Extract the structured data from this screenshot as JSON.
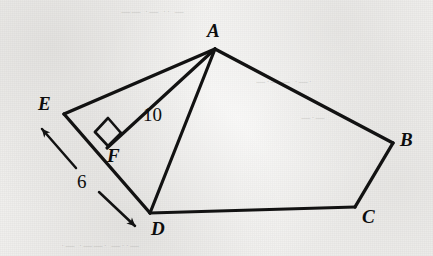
{
  "figure": {
    "domain": "Diagram",
    "kind": "geometry-figure",
    "canvas": {
      "width": 433,
      "height": 256
    },
    "ink_color": "#111111",
    "paper_color": "#f2f1ef"
  },
  "vertices": [
    {
      "id": "A",
      "label": "A",
      "x": 215,
      "y": 49,
      "label_x": 207,
      "label_y": 21
    },
    {
      "id": "B",
      "label": "B",
      "x": 393,
      "y": 143,
      "label_x": 400,
      "label_y": 130
    },
    {
      "id": "C",
      "label": "C",
      "x": 355,
      "y": 207,
      "label_x": 362,
      "label_y": 207
    },
    {
      "id": "D",
      "label": "D",
      "x": 150,
      "y": 213,
      "label_x": 151,
      "label_y": 219
    },
    {
      "id": "E",
      "label": "E",
      "x": 64,
      "y": 114,
      "label_x": 38,
      "label_y": 94
    },
    {
      "id": "F",
      "label": "F",
      "x": 107,
      "y": 148,
      "label_x": 107,
      "label_y": 146
    }
  ],
  "segments": [
    {
      "id": "AB",
      "from": "A",
      "to": "B",
      "kind": "polygon-side"
    },
    {
      "id": "BC",
      "from": "B",
      "to": "C",
      "kind": "polygon-side"
    },
    {
      "id": "CD",
      "from": "C",
      "to": "D",
      "kind": "polygon-side"
    },
    {
      "id": "DE",
      "from": "D",
      "to": "E",
      "kind": "polygon-side"
    },
    {
      "id": "EA",
      "from": "E",
      "to": "A",
      "kind": "polygon-side"
    },
    {
      "id": "AD",
      "from": "A",
      "to": "D",
      "kind": "cevian"
    },
    {
      "id": "AF",
      "from": "A",
      "to": "F",
      "kind": "altitude"
    }
  ],
  "measurements": [
    {
      "id": "len-AF",
      "value": "10",
      "applies_to": "AF",
      "label_x": 143,
      "label_y": 105
    },
    {
      "id": "len-ED",
      "value": "6",
      "applies_to": "DE",
      "label_x": 77,
      "label_y": 172
    }
  ],
  "markers": {
    "right_angle": {
      "id": "right-angle-at-F",
      "at_vertex": "F",
      "size": 16,
      "symbol": "square"
    },
    "dimension_arrow": {
      "id": "dimension-arrow-ED",
      "measures": "DE",
      "start_x": 41,
      "start_y": 127,
      "end_x": 137,
      "end_y": 228,
      "double_headed": true,
      "gap_for_label": true
    }
  }
}
